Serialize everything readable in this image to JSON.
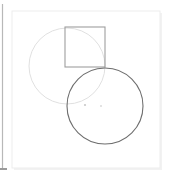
{
  "canvas": {
    "width": 170,
    "height": 180,
    "background": "#ffffff"
  },
  "page_rule": {
    "name": "left-margin-rule",
    "x": 2.5,
    "y_start": 4,
    "y_end": 168,
    "color": "#b8b8b8",
    "width": 1.2,
    "foot_tick": {
      "x_start": 0,
      "x_end": 7,
      "y": 169,
      "color": "#9a9a9a",
      "width": 2
    }
  },
  "card": {
    "name": "figure-card",
    "x": 12,
    "y": 11,
    "width": 148,
    "height": 157,
    "fill": "#ffffff",
    "stroke": "#ededed",
    "stroke_width": 1,
    "shadow_edge": {
      "color": "#f2f2f2",
      "offset": 2
    }
  },
  "figure": {
    "shapes": [
      {
        "id": "light-circle",
        "name": "light-circle",
        "type": "circle",
        "cx": 67,
        "cy": 66,
        "r": 38,
        "stroke": "#dcdcdc",
        "stroke_width": 0.9,
        "fill": "none"
      },
      {
        "id": "inscribed-square",
        "name": "inscribed-square",
        "type": "rect",
        "x": 65,
        "y": 27,
        "width": 40,
        "height": 40,
        "stroke": "#9e9e9e",
        "stroke_width": 1.1,
        "fill": "none"
      },
      {
        "id": "dark-circle",
        "name": "dark-circle",
        "type": "circle",
        "cx": 105,
        "cy": 106,
        "r": 38,
        "stroke": "#6e6e6e",
        "stroke_width": 1.1,
        "fill": "none"
      }
    ],
    "markers": [
      {
        "id": "marker-left",
        "name": "center-marker-left",
        "cx": 85,
        "cy": 105,
        "r": 1.1,
        "fill": "#c9c9c9"
      },
      {
        "id": "marker-right",
        "name": "center-marker-right",
        "cx": 101,
        "cy": 106,
        "r": 1.0,
        "fill": "#dadada"
      }
    ]
  }
}
